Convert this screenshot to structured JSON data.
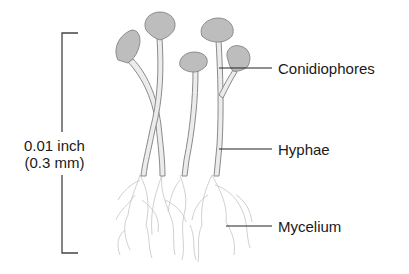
{
  "diagram": {
    "scale": {
      "line1": "0.01 inch",
      "line2": "(0.3 mm)"
    },
    "labels": [
      {
        "id": "conidiophores",
        "text": "Conidiophores"
      },
      {
        "id": "hyphae",
        "text": "Hyphae"
      },
      {
        "id": "mycelium",
        "text": "Mycelium"
      }
    ],
    "colors": {
      "stroke": "#8a8a8a",
      "fill": "#d9d9d9",
      "mycelium": "#bdbdbd",
      "leader": "#222222"
    }
  }
}
